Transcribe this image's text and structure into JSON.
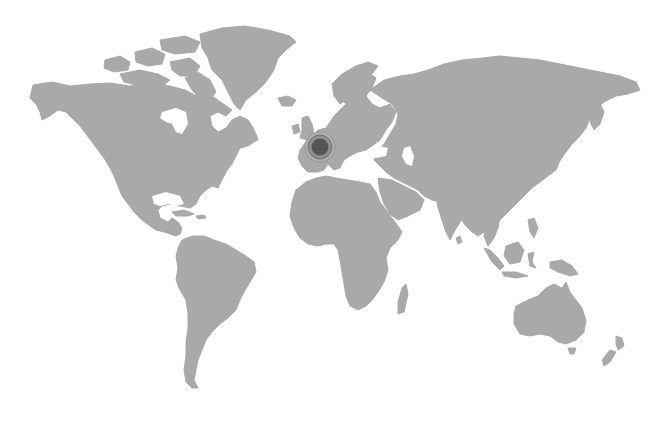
{
  "map": {
    "type": "world-map",
    "land_color": "#a9a9a9",
    "background_color": "#ffffff",
    "marker": {
      "region": "Western Europe (France)",
      "cx": 320,
      "cy": 147,
      "inner_color": "#555555",
      "ring_color": "#8a8a8a",
      "outer_ring_color": "#9a9a9a"
    }
  }
}
